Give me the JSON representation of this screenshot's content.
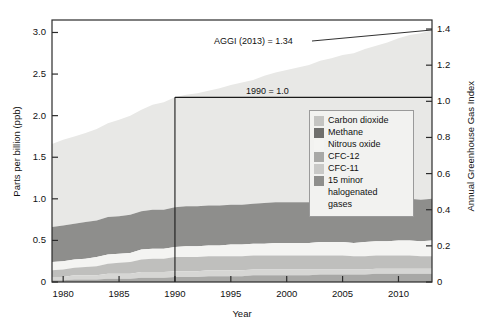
{
  "chart_data": {
    "type": "area",
    "stacked": true,
    "title": "",
    "xlabel": "Year",
    "ylabel": "Parts per billion (ppb)",
    "ylabel_right": "Annual Greenhouse Gas Index",
    "xlim": [
      1979,
      2013
    ],
    "ylim": [
      0,
      3.15
    ],
    "ylim_right": [
      0,
      1.45
    ],
    "grid": false,
    "xticks": [
      1980,
      1985,
      1990,
      1995,
      2000,
      2005,
      2010
    ],
    "xticklabels": [
      "1980",
      "1985",
      "1990",
      "1995",
      "2000",
      "2005",
      "2010"
    ],
    "yticks": [
      0,
      0.5,
      1.0,
      1.5,
      2.0,
      2.5,
      3.0
    ],
    "yticklabels": [
      "0",
      "0.5",
      "1.0",
      "1.5",
      "2.0",
      "2.5",
      "3.0"
    ],
    "yticks_right": [
      0,
      0.2,
      0.4,
      0.6,
      0.8,
      1.0,
      1.2,
      1.4
    ],
    "yticklabels_right": [
      "0",
      "0.2",
      "0.4",
      "0.6",
      "0.8",
      "1.0",
      "1.2",
      "1.4"
    ],
    "x": [
      1979,
      1980,
      1981,
      1982,
      1983,
      1984,
      1985,
      1986,
      1987,
      1988,
      1989,
      1990,
      1991,
      1992,
      1993,
      1994,
      1995,
      1996,
      1997,
      1998,
      1999,
      2000,
      2001,
      2002,
      2003,
      2004,
      2005,
      2006,
      2007,
      2008,
      2009,
      2010,
      2011,
      2012,
      2013
    ],
    "legend_position": "center-right",
    "series": [
      {
        "name": "Carbon dioxide",
        "color": "#e8e8e6",
        "values": [
          1.0,
          1.03,
          1.05,
          1.07,
          1.1,
          1.13,
          1.16,
          1.19,
          1.22,
          1.26,
          1.29,
          1.32,
          1.34,
          1.36,
          1.38,
          1.41,
          1.44,
          1.47,
          1.49,
          1.53,
          1.56,
          1.59,
          1.62,
          1.65,
          1.69,
          1.72,
          1.76,
          1.79,
          1.83,
          1.86,
          1.89,
          1.93,
          1.97,
          2.0,
          2.03
        ]
      },
      {
        "name": "Methane",
        "color": "#8e8e8c",
        "values": [
          0.42,
          0.43,
          0.43,
          0.44,
          0.44,
          0.45,
          0.45,
          0.46,
          0.46,
          0.47,
          0.47,
          0.48,
          0.48,
          0.48,
          0.48,
          0.48,
          0.48,
          0.48,
          0.48,
          0.49,
          0.49,
          0.49,
          0.49,
          0.49,
          0.49,
          0.49,
          0.49,
          0.49,
          0.49,
          0.49,
          0.5,
          0.5,
          0.5,
          0.5,
          0.5
        ]
      },
      {
        "name": "Nitrous oxide",
        "color": "#f4f4f2",
        "values": [
          0.1,
          0.1,
          0.1,
          0.1,
          0.11,
          0.11,
          0.11,
          0.11,
          0.12,
          0.12,
          0.12,
          0.12,
          0.13,
          0.13,
          0.13,
          0.13,
          0.14,
          0.14,
          0.14,
          0.14,
          0.15,
          0.15,
          0.15,
          0.15,
          0.16,
          0.16,
          0.16,
          0.16,
          0.17,
          0.17,
          0.17,
          0.18,
          0.18,
          0.18,
          0.19
        ]
      },
      {
        "name": "CFC-12",
        "color": "#bfbfbd",
        "values": [
          0.08,
          0.09,
          0.09,
          0.1,
          0.11,
          0.12,
          0.13,
          0.14,
          0.15,
          0.16,
          0.16,
          0.17,
          0.17,
          0.17,
          0.17,
          0.17,
          0.17,
          0.17,
          0.17,
          0.17,
          0.17,
          0.17,
          0.17,
          0.17,
          0.17,
          0.17,
          0.17,
          0.16,
          0.16,
          0.16,
          0.16,
          0.16,
          0.16,
          0.15,
          0.15
        ]
      },
      {
        "name": "CFC-11",
        "color": "#d6d6d4",
        "values": [
          0.04,
          0.04,
          0.05,
          0.05,
          0.05,
          0.06,
          0.06,
          0.06,
          0.07,
          0.07,
          0.07,
          0.07,
          0.07,
          0.07,
          0.07,
          0.07,
          0.07,
          0.07,
          0.07,
          0.07,
          0.07,
          0.07,
          0.07,
          0.07,
          0.06,
          0.06,
          0.06,
          0.06,
          0.06,
          0.06,
          0.06,
          0.06,
          0.06,
          0.06,
          0.06
        ]
      },
      {
        "name": "15 minor halogenated gases",
        "color": "#a8a8a6",
        "values": [
          0.02,
          0.02,
          0.03,
          0.03,
          0.03,
          0.04,
          0.04,
          0.04,
          0.05,
          0.05,
          0.05,
          0.06,
          0.06,
          0.06,
          0.07,
          0.07,
          0.07,
          0.07,
          0.08,
          0.08,
          0.08,
          0.08,
          0.08,
          0.08,
          0.09,
          0.09,
          0.09,
          0.09,
          0.09,
          0.1,
          0.1,
          0.1,
          0.1,
          0.1,
          0.1
        ]
      }
    ],
    "annotations": [
      {
        "name": "aggi-2013",
        "text": "AGGI (2013) = 1.34",
        "x": 2013,
        "y": 1.34
      },
      {
        "name": "baseline-1990",
        "text": "1990 = 1.0",
        "x": 1990,
        "y": 1.0
      }
    ]
  },
  "legend": {
    "items": [
      {
        "label": "Carbon dioxide",
        "color": "#c4c4c2"
      },
      {
        "label": "Methane",
        "color": "#6e6e6c"
      },
      {
        "label": "Nitrous oxide",
        "color": "#f4f4f2"
      },
      {
        "label": "CFC-12",
        "color": "#a8a8a6"
      },
      {
        "label": "CFC-11",
        "color": "#c9c9c7"
      },
      {
        "label": "15 minor",
        "color": "#8e8e8c"
      },
      {
        "label": "halogenated",
        "color": null
      },
      {
        "label": "gases",
        "color": null
      }
    ]
  },
  "axes": {
    "left_title": "Parts per billion (ppb)",
    "right_title": "Annual Greenhouse Gas Index",
    "bottom_title": "Year"
  },
  "annotations": {
    "aggi": "AGGI (2013) = 1.34",
    "baseline": "1990 = 1.0"
  }
}
